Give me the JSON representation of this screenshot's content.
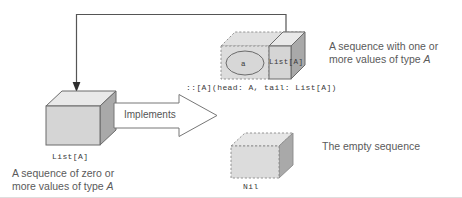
{
  "diagram": {
    "colors": {
      "box_front": "#d4d4d4",
      "box_top": "#e8e8e8",
      "box_side": "#a8a8a8",
      "outline": "#6b6b6b",
      "dashed_outline": "#8a8a8a",
      "arrow_line": "#555555",
      "text_mono": "#3a3a3a",
      "text_caption": "#5a5a5a",
      "background": "#ffffff"
    },
    "nodes": {
      "list_box": {
        "label": "List[A]",
        "caption_line1": "A sequence of zero or",
        "caption_line2": "more values of type ",
        "caption_italic": "A"
      },
      "cons_box": {
        "head_label": "a",
        "tail_label": "List[A]",
        "signature": "::[A](head: A, tail: List[A])",
        "caption_line1": "A sequence with one or",
        "caption_line2": "more values of type ",
        "caption_italic": "A"
      },
      "nil_box": {
        "label": "Nil",
        "caption": "The empty sequence"
      }
    },
    "implements_arrow": {
      "label": "Implements"
    },
    "recursion_arrow": {
      "name": "recursive-reference-arrow"
    }
  }
}
